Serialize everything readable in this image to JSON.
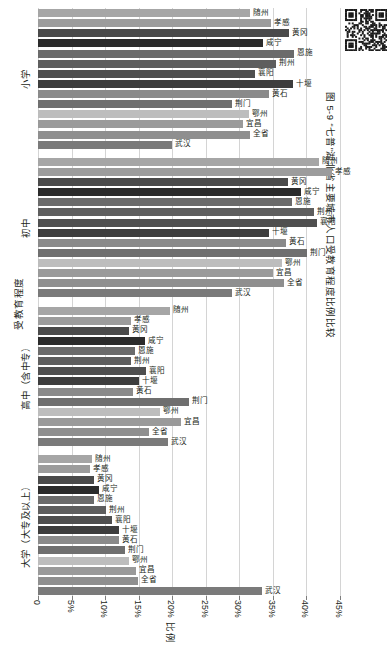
{
  "figure": {
    "caption": "图 5-9  “七普”湖北省主要城市人口受教育程度比例比较",
    "qr_icon": "qr-code-icon"
  },
  "axes": {
    "y_title": "受教育程度",
    "x_title": "比例",
    "x_ticks": [
      "0",
      "5%",
      "10%",
      "15%",
      "20%",
      "25%",
      "30%",
      "35%",
      "40%",
      "45%"
    ],
    "x_tick_values": [
      0,
      5,
      10,
      15,
      20,
      25,
      30,
      35,
      40,
      45
    ],
    "xlim": [
      0,
      45
    ],
    "grid": true
  },
  "series_colors": {
    "随州": "#a6a6a6",
    "孝感": "#9c9c9c",
    "黄冈": "#4a4a4a",
    "咸宁": "#2b2b2b",
    "恩施": "#6b6b6b",
    "荆州": "#5e5e5e",
    "襄阳": "#4f4f4f",
    "十堰": "#3d3d3d",
    "黄石": "#8a8a8a",
    "荆门": "#6f6f6f",
    "鄂州": "#bdbdbd",
    "宜昌": "#9a9a9a",
    "全省": "#8f8f8f",
    "武汉": "#7a7a7a"
  },
  "chart_data": {
    "type": "bar",
    "orientation": "horizontal",
    "title": "“七普”湖北省主要城市人口受教育程度比例比较",
    "xlabel": "比例",
    "ylabel": "受教育程度",
    "xlim": [
      0,
      45
    ],
    "grid": true,
    "legend": "none",
    "value_unit": "%",
    "categories": [
      "小学",
      "初中",
      "高中（含中专）",
      "大学（大专及以上）"
    ],
    "cities": [
      "随州",
      "孝感",
      "黄冈",
      "咸宁",
      "恩施",
      "荆州",
      "襄阳",
      "十堰",
      "黄石",
      "荆门",
      "鄂州",
      "宜昌",
      "全省",
      "武汉"
    ],
    "groups": [
      {
        "name": "小学",
        "bars": [
          {
            "city": "随州",
            "value": 31.6
          },
          {
            "city": "孝感",
            "value": 34.7
          },
          {
            "city": "黄冈",
            "value": 37.4
          },
          {
            "city": "咸宁",
            "value": 33.6
          },
          {
            "city": "恩施",
            "value": 38.2
          },
          {
            "city": "荆州",
            "value": 35.5
          },
          {
            "city": "襄阳",
            "value": 32.4
          },
          {
            "city": "十堰",
            "value": 38.0
          },
          {
            "city": "黄石",
            "value": 34.4
          },
          {
            "city": "荆门",
            "value": 28.9
          },
          {
            "city": "鄂州",
            "value": 31.5
          },
          {
            "city": "宜昌",
            "value": 30.5
          },
          {
            "city": "全省",
            "value": 31.6
          },
          {
            "city": "武汉",
            "value": 20.0
          }
        ]
      },
      {
        "name": "初中",
        "bars": [
          {
            "city": "随州",
            "value": 41.9
          },
          {
            "city": "孝感",
            "value": 43.8
          },
          {
            "city": "黄冈",
            "value": 37.2
          },
          {
            "city": "咸宁",
            "value": 39.2
          },
          {
            "city": "恩施",
            "value": 37.8
          },
          {
            "city": "荆州",
            "value": 41.2
          },
          {
            "city": "襄阳",
            "value": 41.6
          },
          {
            "city": "十堰",
            "value": 34.4
          },
          {
            "city": "黄石",
            "value": 37.0
          },
          {
            "city": "荆门",
            "value": 40.1
          },
          {
            "city": "鄂州",
            "value": 36.4
          },
          {
            "city": "宜昌",
            "value": 35.0
          },
          {
            "city": "全省",
            "value": 36.7
          },
          {
            "city": "武汉",
            "value": 28.9
          }
        ]
      },
      {
        "name": "高中（含中专）",
        "bars": [
          {
            "city": "随州",
            "value": 19.6
          },
          {
            "city": "孝感",
            "value": 13.8
          },
          {
            "city": "黄冈",
            "value": 13.5
          },
          {
            "city": "咸宁",
            "value": 15.9
          },
          {
            "city": "恩施",
            "value": 14.4
          },
          {
            "city": "荆州",
            "value": 13.9
          },
          {
            "city": "襄阳",
            "value": 16.1
          },
          {
            "city": "十堰",
            "value": 15.0
          },
          {
            "city": "黄石",
            "value": 14.2
          },
          {
            "city": "荆门",
            "value": 22.5
          },
          {
            "city": "鄂州",
            "value": 18.2
          },
          {
            "city": "宜昌",
            "value": 21.3
          },
          {
            "city": "全省",
            "value": 16.6
          },
          {
            "city": "武汉",
            "value": 19.3
          }
        ]
      },
      {
        "name": "大学（大专及以上）",
        "bars": [
          {
            "city": "随州",
            "value": 8.0
          },
          {
            "city": "孝感",
            "value": 7.8
          },
          {
            "city": "黄冈",
            "value": 8.4
          },
          {
            "city": "咸宁",
            "value": 9.1
          },
          {
            "city": "恩施",
            "value": 8.4
          },
          {
            "city": "荆州",
            "value": 10.2
          },
          {
            "city": "襄阳",
            "value": 11.0
          },
          {
            "city": "十堰",
            "value": 12.0
          },
          {
            "city": "黄石",
            "value": 12.0
          },
          {
            "city": "荆门",
            "value": 13.0
          },
          {
            "city": "鄂州",
            "value": 13.6
          },
          {
            "city": "宜昌",
            "value": 14.6
          },
          {
            "city": "全省",
            "value": 14.9
          },
          {
            "city": "武汉",
            "value": 33.4
          }
        ]
      }
    ]
  }
}
